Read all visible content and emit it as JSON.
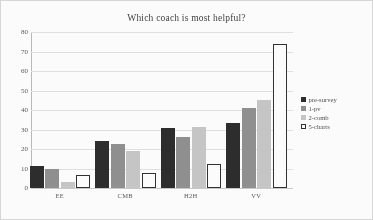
{
  "chart_data": {
    "type": "bar",
    "title": "Which coach is most helpful?",
    "xlabel": "",
    "ylabel": "",
    "ylim": [
      0,
      80
    ],
    "yticks": [
      80,
      70,
      60,
      50,
      40,
      30,
      20,
      10,
      0
    ],
    "grid": true,
    "legend_position": "right",
    "categories": [
      "EE",
      "CMB",
      "H2H",
      "VV"
    ],
    "series": [
      {
        "name": "pre-survey",
        "color": "#262626",
        "values": [
          11.5,
          24,
          31,
          33.5
        ]
      },
      {
        "name": "1-pv",
        "color": "#8d8d8d",
        "values": [
          10,
          22.5,
          26,
          41
        ]
      },
      {
        "name": "2-comb",
        "color": "#c6c6c6",
        "values": [
          3,
          19,
          31.5,
          45
        ]
      },
      {
        "name": "5-charts",
        "color": "#ffffff",
        "values": [
          6.5,
          7.5,
          12.5,
          74
        ]
      }
    ]
  },
  "legend": {
    "items": [
      {
        "label": "pre-survey"
      },
      {
        "label": "1-pv"
      },
      {
        "label": "2-comb"
      },
      {
        "label": "5-charts"
      }
    ]
  }
}
